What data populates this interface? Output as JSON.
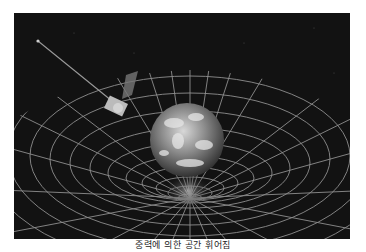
{
  "figure": {
    "colors": {
      "background": "#111111",
      "grid": "#9a9a9a",
      "earth": "#8a8a8a",
      "page": "#ffffff"
    }
  },
  "caption": {
    "text": "중력에 의한 공간 휘어짐"
  }
}
